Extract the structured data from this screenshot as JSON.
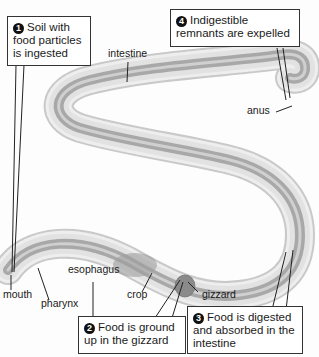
{
  "diagram": {
    "callouts": [
      {
        "number": "1",
        "text": "Soil with food particles is ingested"
      },
      {
        "number": "2",
        "text": "Food is ground up in the gizzard"
      },
      {
        "number": "3",
        "text": "Food is digested and absorbed in the intestine"
      },
      {
        "number": "4",
        "text": "Indigestible remnants are expelled"
      }
    ],
    "labels": {
      "intestine": "intestine",
      "anus": "anus",
      "mouth": "mouth",
      "pharynx": "pharynx",
      "esophagus": "esophagus",
      "crop": "crop",
      "gizzard": "gizzard"
    },
    "colors": {
      "body": "#e4e4e4",
      "gut": "#b8b8b8",
      "outline": "#9a9a9a",
      "callout_border": "#333333"
    }
  }
}
